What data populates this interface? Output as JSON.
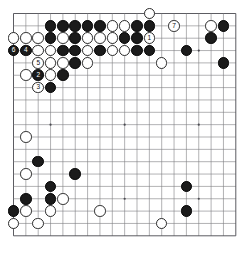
{
  "diagram": {
    "kind": "go-board-diagram",
    "board_size": 19,
    "geometry": {
      "left": 13.5,
      "top": 13.5,
      "spacing": 12.35,
      "stone_diameter": 11.6,
      "line_color": "#7d7d82",
      "edge_color": "#4a4a50",
      "background": "#ffffff",
      "star_point_radius": 1.1
    },
    "star_points": [
      [
        3,
        3
      ],
      [
        9,
        3
      ],
      [
        15,
        3
      ],
      [
        3,
        9
      ],
      [
        9,
        9
      ],
      [
        15,
        9
      ],
      [
        3,
        15
      ],
      [
        9,
        15
      ],
      [
        15,
        15
      ]
    ],
    "colors": {
      "black": "#1b1b1b",
      "white": "#ffffff",
      "white_border": "#2a2a2a"
    },
    "stones": [
      {
        "col": 11,
        "row": 0,
        "color": "white",
        "label": ""
      },
      {
        "col": 3,
        "row": 1,
        "color": "black",
        "label": ""
      },
      {
        "col": 4,
        "row": 1,
        "color": "black",
        "label": ""
      },
      {
        "col": 5,
        "row": 1,
        "color": "black",
        "label": ""
      },
      {
        "col": 6,
        "row": 1,
        "color": "black",
        "label": ""
      },
      {
        "col": 7,
        "row": 1,
        "color": "black",
        "label": ""
      },
      {
        "col": 8,
        "row": 1,
        "color": "white",
        "label": ""
      },
      {
        "col": 9,
        "row": 1,
        "color": "white",
        "label": ""
      },
      {
        "col": 10,
        "row": 1,
        "color": "black",
        "label": ""
      },
      {
        "col": 11,
        "row": 1,
        "color": "black",
        "label": ""
      },
      {
        "col": 13,
        "row": 1,
        "color": "white",
        "label": "7"
      },
      {
        "col": 16,
        "row": 1,
        "color": "white",
        "label": ""
      },
      {
        "col": 17,
        "row": 1,
        "color": "black",
        "label": ""
      },
      {
        "col": 0,
        "row": 2,
        "color": "white",
        "label": ""
      },
      {
        "col": 1,
        "row": 2,
        "color": "white",
        "label": ""
      },
      {
        "col": 2,
        "row": 2,
        "color": "white",
        "label": ""
      },
      {
        "col": 3,
        "row": 2,
        "color": "black",
        "label": ""
      },
      {
        "col": 4,
        "row": 2,
        "color": "white",
        "label": ""
      },
      {
        "col": 5,
        "row": 2,
        "color": "black",
        "label": ""
      },
      {
        "col": 6,
        "row": 2,
        "color": "white",
        "label": ""
      },
      {
        "col": 7,
        "row": 2,
        "color": "white",
        "label": ""
      },
      {
        "col": 8,
        "row": 2,
        "color": "white",
        "label": ""
      },
      {
        "col": 9,
        "row": 2,
        "color": "black",
        "label": ""
      },
      {
        "col": 10,
        "row": 2,
        "color": "black",
        "label": ""
      },
      {
        "col": 11,
        "row": 2,
        "color": "white",
        "label": "1"
      },
      {
        "col": 16,
        "row": 2,
        "color": "black",
        "label": ""
      },
      {
        "col": 0,
        "row": 3,
        "color": "black",
        "label": "6"
      },
      {
        "col": 1,
        "row": 3,
        "color": "black",
        "label": "4"
      },
      {
        "col": 2,
        "row": 3,
        "color": "white",
        "label": ""
      },
      {
        "col": 3,
        "row": 3,
        "color": "white",
        "label": ""
      },
      {
        "col": 4,
        "row": 3,
        "color": "black",
        "label": ""
      },
      {
        "col": 5,
        "row": 3,
        "color": "black",
        "label": ""
      },
      {
        "col": 6,
        "row": 3,
        "color": "white",
        "label": ""
      },
      {
        "col": 7,
        "row": 3,
        "color": "black",
        "label": ""
      },
      {
        "col": 8,
        "row": 3,
        "color": "white",
        "label": ""
      },
      {
        "col": 9,
        "row": 3,
        "color": "white",
        "label": ""
      },
      {
        "col": 10,
        "row": 3,
        "color": "black",
        "label": ""
      },
      {
        "col": 11,
        "row": 3,
        "color": "black",
        "label": ""
      },
      {
        "col": 14,
        "row": 3,
        "color": "black",
        "label": ""
      },
      {
        "col": 2,
        "row": 4,
        "color": "white",
        "label": "5"
      },
      {
        "col": 3,
        "row": 4,
        "color": "white",
        "label": ""
      },
      {
        "col": 4,
        "row": 4,
        "color": "white",
        "label": ""
      },
      {
        "col": 5,
        "row": 4,
        "color": "black",
        "label": ""
      },
      {
        "col": 6,
        "row": 4,
        "color": "white",
        "label": ""
      },
      {
        "col": 12,
        "row": 4,
        "color": "white",
        "label": ""
      },
      {
        "col": 17,
        "row": 4,
        "color": "black",
        "label": ""
      },
      {
        "col": 1,
        "row": 5,
        "color": "white",
        "label": ""
      },
      {
        "col": 2,
        "row": 5,
        "color": "black",
        "label": "2"
      },
      {
        "col": 3,
        "row": 5,
        "color": "white",
        "label": ""
      },
      {
        "col": 4,
        "row": 5,
        "color": "black",
        "label": ""
      },
      {
        "col": 2,
        "row": 6,
        "color": "white",
        "label": "3"
      },
      {
        "col": 3,
        "row": 6,
        "color": "black",
        "label": ""
      },
      {
        "col": 1,
        "row": 10,
        "color": "white",
        "label": ""
      },
      {
        "col": 2,
        "row": 12,
        "color": "black",
        "label": ""
      },
      {
        "col": 5,
        "row": 13,
        "color": "black",
        "label": ""
      },
      {
        "col": 1,
        "row": 13,
        "color": "white",
        "label": ""
      },
      {
        "col": 3,
        "row": 14,
        "color": "black",
        "label": ""
      },
      {
        "col": 14,
        "row": 14,
        "color": "black",
        "label": ""
      },
      {
        "col": 1,
        "row": 15,
        "color": "black",
        "label": ""
      },
      {
        "col": 3,
        "row": 15,
        "color": "black",
        "label": ""
      },
      {
        "col": 4,
        "row": 15,
        "color": "white",
        "label": ""
      },
      {
        "col": 0,
        "row": 16,
        "color": "black",
        "label": ""
      },
      {
        "col": 1,
        "row": 16,
        "color": "white",
        "label": ""
      },
      {
        "col": 3,
        "row": 16,
        "color": "white",
        "label": ""
      },
      {
        "col": 7,
        "row": 16,
        "color": "white",
        "label": ""
      },
      {
        "col": 14,
        "row": 16,
        "color": "black",
        "label": ""
      },
      {
        "col": 0,
        "row": 17,
        "color": "white",
        "label": ""
      },
      {
        "col": 2,
        "row": 17,
        "color": "white",
        "label": ""
      },
      {
        "col": 12,
        "row": 17,
        "color": "white",
        "label": ""
      }
    ]
  }
}
